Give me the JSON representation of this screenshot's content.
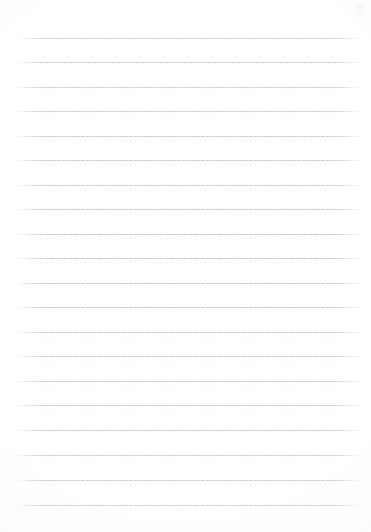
{
  "document": {
    "kind": "lined-notebook-paper",
    "title": "Blank Lined Paper",
    "page_width": 371,
    "page_height": 532,
    "background_color": "#ffffff",
    "has_written_content": false,
    "text_content": "",
    "header_text": "",
    "footer_text": "",
    "page_number": ""
  },
  "ruling": {
    "line_color": "#b0b5be",
    "sub_line_color": "#e1e4e9",
    "line_thickness": 1,
    "line_spacing": 25,
    "left_margin": 15,
    "right_margin": 11,
    "line_start_x": 15,
    "line_end_x": 360,
    "line_count": 20,
    "first_line_y": 38,
    "last_line_y": 505,
    "style": "dotted-dashed-scan",
    "margin_rule_visible": false
  },
  "lines": [
    {
      "index": 1,
      "y": 38,
      "x1": 17,
      "x2": 360,
      "opacity": 0.78,
      "text": ""
    },
    {
      "index": 2,
      "y": 62,
      "x1": 16,
      "x2": 360,
      "opacity": 0.8,
      "text": ""
    },
    {
      "index": 3,
      "y": 87,
      "x1": 15,
      "x2": 360,
      "opacity": 0.82,
      "text": ""
    },
    {
      "index": 4,
      "y": 111,
      "x1": 15,
      "x2": 360,
      "opacity": 0.84,
      "text": ""
    },
    {
      "index": 5,
      "y": 136,
      "x1": 15,
      "x2": 360,
      "opacity": 0.86,
      "text": ""
    },
    {
      "index": 6,
      "y": 160,
      "x1": 15,
      "x2": 360,
      "opacity": 0.88,
      "text": ""
    },
    {
      "index": 7,
      "y": 185,
      "x1": 15,
      "x2": 360,
      "opacity": 0.88,
      "text": ""
    },
    {
      "index": 8,
      "y": 209,
      "x1": 15,
      "x2": 360,
      "opacity": 0.9,
      "text": ""
    },
    {
      "index": 9,
      "y": 234,
      "x1": 15,
      "x2": 360,
      "opacity": 0.9,
      "text": ""
    },
    {
      "index": 10,
      "y": 258,
      "x1": 15,
      "x2": 360,
      "opacity": 0.92,
      "text": ""
    },
    {
      "index": 11,
      "y": 283,
      "x1": 15,
      "x2": 360,
      "opacity": 0.92,
      "text": ""
    },
    {
      "index": 12,
      "y": 307,
      "x1": 15,
      "x2": 360,
      "opacity": 0.9,
      "text": ""
    },
    {
      "index": 13,
      "y": 332,
      "x1": 15,
      "x2": 360,
      "opacity": 0.9,
      "text": ""
    },
    {
      "index": 14,
      "y": 356,
      "x1": 15,
      "x2": 360,
      "opacity": 0.88,
      "text": ""
    },
    {
      "index": 15,
      "y": 381,
      "x1": 15,
      "x2": 360,
      "opacity": 0.88,
      "text": ""
    },
    {
      "index": 16,
      "y": 405,
      "x1": 15,
      "x2": 360,
      "opacity": 0.86,
      "text": ""
    },
    {
      "index": 17,
      "y": 430,
      "x1": 15,
      "x2": 360,
      "opacity": 0.86,
      "text": ""
    },
    {
      "index": 18,
      "y": 455,
      "x1": 15,
      "x2": 360,
      "opacity": 0.84,
      "text": ""
    },
    {
      "index": 19,
      "y": 480,
      "x1": 15,
      "x2": 360,
      "opacity": 0.82,
      "text": ""
    },
    {
      "index": 20,
      "y": 505,
      "x1": 15,
      "x2": 360,
      "opacity": 0.8,
      "text": ""
    }
  ]
}
